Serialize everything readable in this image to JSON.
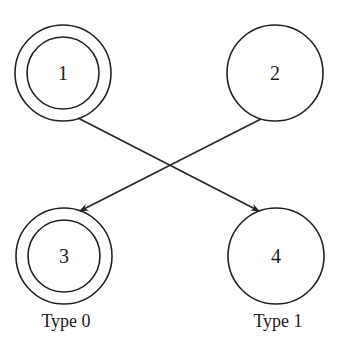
{
  "diagram": {
    "nodes": [
      {
        "id": "1",
        "label": "1",
        "cx": 63,
        "cy": 73,
        "r": 48,
        "double": true,
        "inner_r": 36
      },
      {
        "id": "2",
        "label": "2",
        "cx": 275,
        "cy": 73,
        "r": 48,
        "double": false
      },
      {
        "id": "3",
        "label": "3",
        "cx": 64,
        "cy": 256,
        "r": 48,
        "double": true,
        "inner_r": 36
      },
      {
        "id": "4",
        "label": "4",
        "cx": 276,
        "cy": 256,
        "r": 48,
        "double": false
      }
    ],
    "edges": [
      {
        "from": "1",
        "to": "4",
        "x1": 78,
        "y1": 118,
        "x2": 259,
        "y2": 211
      },
      {
        "from": "2",
        "to": "3",
        "x1": 261,
        "y1": 119,
        "x2": 80,
        "y2": 211
      }
    ],
    "type_labels": [
      {
        "text": "Type 0",
        "x": 66,
        "y": 327
      },
      {
        "text": "Type 1",
        "x": 278,
        "y": 327
      }
    ],
    "colors": {
      "stroke": "#222222",
      "background": "#ffffff",
      "text": "#1a1a1a"
    }
  }
}
